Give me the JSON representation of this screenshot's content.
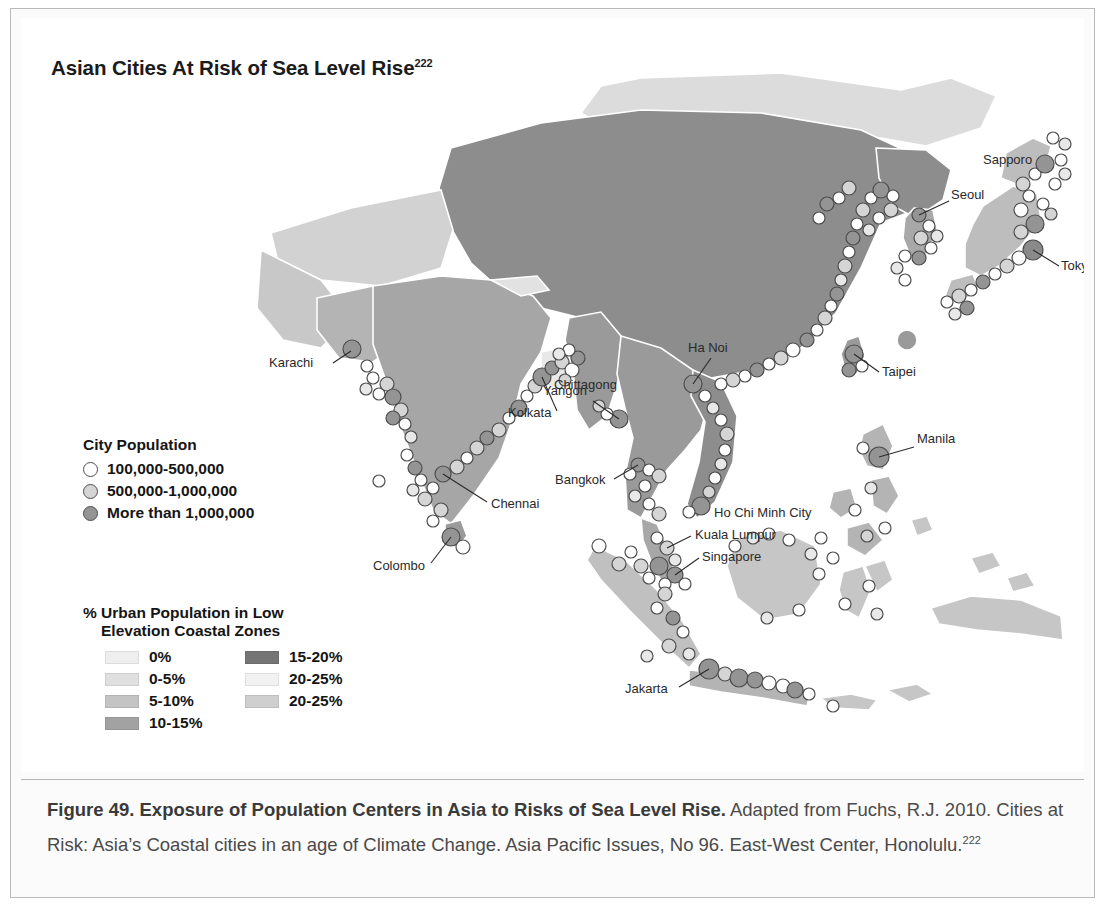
{
  "figure": {
    "map_title": "Asian Cities At Risk of Sea Level Rise",
    "map_title_superscript": "222",
    "caption_bold": "Figure 49. Exposure of Population Centers in Asia to Risks of Sea Level Rise.",
    "caption_rest": " Adapted from Fuchs, R.J. 2010. Cities at Risk: Asia’s Coastal cities in an age of Climate Change. Asia Pacific Issues, No 96. East-West Center, Honolulu.",
    "caption_superscript": "222"
  },
  "city_legend": {
    "title": "City Population",
    "items": [
      {
        "label": "100,000-500,000",
        "color": "#ffffff"
      },
      {
        "label": "500,000-1,000,000",
        "color": "#d5d5d5"
      },
      {
        "label": "More than 1,000,000",
        "color": "#949494"
      }
    ]
  },
  "zone_legend": {
    "title_line1": "% Urban Population in Low",
    "title_line2": "Elevation Coastal Zones",
    "left_items": [
      {
        "label": "0%",
        "color": "#efefef"
      },
      {
        "label": "0-5%",
        "color": "#e0e0e0"
      },
      {
        "label": "5-10%",
        "color": "#c4c4c4"
      },
      {
        "label": "10-15%",
        "color": "#a2a2a2"
      }
    ],
    "right_items": [
      {
        "label": "15-20%",
        "color": "#757575"
      },
      {
        "label": "20-25%",
        "color": "#f2f2f2"
      },
      {
        "label": "20-25%",
        "color": "#cfcfcf"
      }
    ]
  },
  "map": {
    "background_color": "#ffffff",
    "city_labels": [
      {
        "name": "Karachi",
        "x": 248,
        "y": 349,
        "anchor": "start",
        "leader": [
          312,
          345,
          330,
          333
        ]
      },
      {
        "name": "Kolkata",
        "x": 487,
        "y": 399,
        "anchor": "start",
        "leader": [
          536,
          393,
          521,
          359
        ]
      },
      {
        "name": "Chittagong",
        "x": 533,
        "y": 371,
        "anchor": "start",
        "leader": null
      },
      {
        "name": "Yangon",
        "x": 522,
        "y": 377,
        "anchor": "start",
        "leader": [
          572,
          383,
          598,
          401
        ]
      },
      {
        "name": "Chennai",
        "x": 470,
        "y": 490,
        "anchor": "start",
        "leader": [
          466,
          484,
          422,
          456
        ]
      },
      {
        "name": "Colombo",
        "x": 352,
        "y": 552,
        "anchor": "start",
        "leader": [
          410,
          545,
          430,
          519
        ]
      },
      {
        "name": "Bangkok",
        "x": 534,
        "y": 466,
        "anchor": "start",
        "leader": [
          593,
          461,
          617,
          447
        ]
      },
      {
        "name": "Ho Chi Minh City",
        "x": 693,
        "y": 499,
        "anchor": "start",
        "leader": null
      },
      {
        "name": "Kuala Lumpur",
        "x": 674,
        "y": 521,
        "anchor": "start",
        "leader": [
          670,
          518,
          646,
          530
        ]
      },
      {
        "name": "Singapore",
        "x": 681,
        "y": 543,
        "anchor": "start",
        "leader": [
          678,
          540,
          654,
          557
        ]
      },
      {
        "name": "Jakarta",
        "x": 604,
        "y": 675,
        "anchor": "start",
        "leader": [
          658,
          669,
          688,
          651
        ]
      },
      {
        "name": "Ha Noi",
        "x": 667,
        "y": 334,
        "anchor": "start",
        "leader": [
          690,
          340,
          672,
          366
        ]
      },
      {
        "name": "Taipei",
        "x": 861,
        "y": 358,
        "anchor": "start",
        "leader": [
          858,
          354,
          833,
          336
        ]
      },
      {
        "name": "Manila",
        "x": 896,
        "y": 425,
        "anchor": "start",
        "leader": [
          893,
          429,
          858,
          439
        ]
      },
      {
        "name": "Seoul",
        "x": 930,
        "y": 181,
        "anchor": "start",
        "leader": [
          928,
          183,
          898,
          197
        ]
      },
      {
        "name": "Sapporo",
        "x": 962,
        "y": 146,
        "anchor": "start",
        "leader": null
      },
      {
        "name": "Tokyo",
        "x": 1040,
        "y": 252,
        "anchor": "start",
        "leader": [
          1038,
          248,
          1012,
          232
        ]
      }
    ]
  },
  "chart_data": {
    "type": "map",
    "title": "Asian Cities At Risk of Sea Level Rise",
    "legend_position": "lower-left",
    "choropleth_classes": [
      "0%",
      "0-5%",
      "5-10%",
      "10-15%",
      "15-20%",
      "20-25%",
      "20-25%"
    ],
    "symbol_classes": [
      "100,000-500,000",
      "500,000-1,000,000",
      "More than 1,000,000"
    ],
    "labeled_cities": [
      "Karachi",
      "Kolkata",
      "Chittagong",
      "Yangon",
      "Chennai",
      "Colombo",
      "Bangkok",
      "Ho Chi Minh City",
      "Kuala Lumpur",
      "Singapore",
      "Jakarta",
      "Ha Noi",
      "Taipei",
      "Manila",
      "Seoul",
      "Sapporo",
      "Tokyo"
    ]
  }
}
